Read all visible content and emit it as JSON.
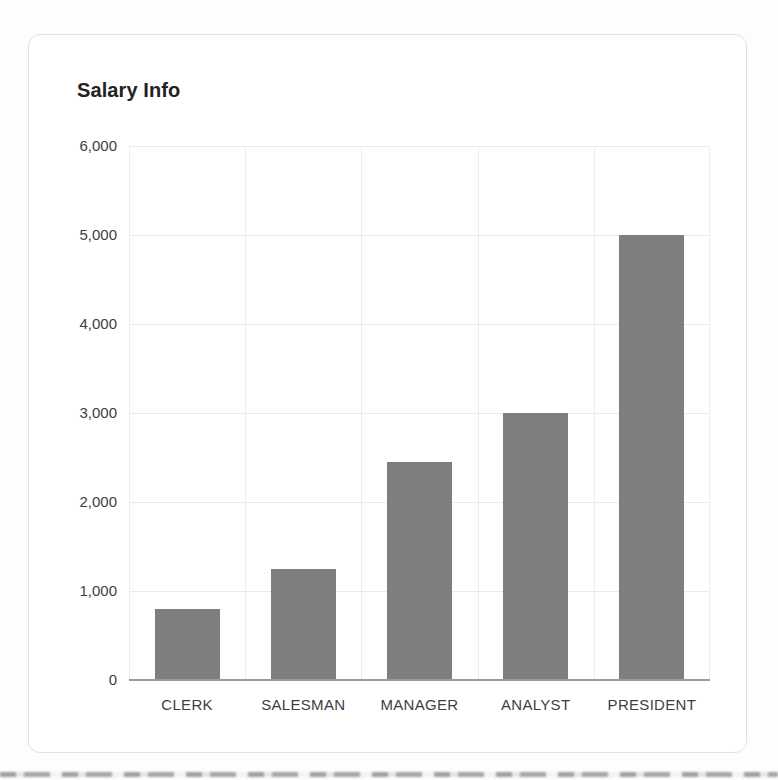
{
  "chart_data": {
    "type": "bar",
    "title": "Salary Info",
    "categories": [
      "CLERK",
      "SALESMAN",
      "MANAGER",
      "ANALYST",
      "PRESIDENT"
    ],
    "values": [
      800,
      1250,
      2450,
      3000,
      5000
    ],
    "xlabel": "",
    "ylabel": "",
    "ylim": [
      0,
      6000
    ],
    "ytick_interval": 1000,
    "ytick_labels": [
      "0",
      "1,000",
      "2,000",
      "3,000",
      "4,000",
      "5,000",
      "6,000"
    ],
    "grid": true,
    "legend": "none"
  },
  "colors": {
    "bar": "#7e7e7e",
    "grid": "#eaeaea",
    "vgrid": "#ededed",
    "baseline": "#9b9b9b",
    "title_text": "#222222",
    "axis_text": "#3e3e3e",
    "card_border": "#e1e1e1",
    "background": "#fdfdfd"
  }
}
